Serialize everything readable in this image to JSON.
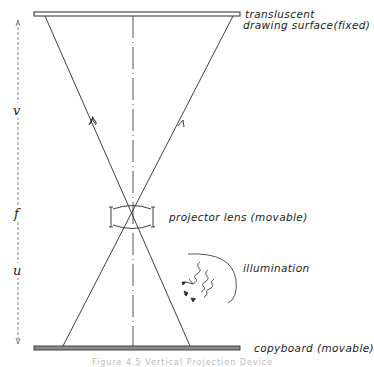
{
  "diagram": {
    "labels": {
      "drawing_surface_line1": "transluscent",
      "drawing_surface_line2": "drawing surface(fixed)",
      "lens": "projector lens (movable)",
      "illumination": "illumination",
      "copyboard": "copyboard (movable)"
    },
    "dimensions": {
      "image_distance": "v",
      "focal": "f",
      "object_distance": "u"
    },
    "caption": "Figure 4.5 Vertical Projection Device",
    "colors": {
      "line": "#2a2a2a",
      "copyboard_fill": "#8a8a8a",
      "surface_fill": "#ffffff"
    }
  }
}
